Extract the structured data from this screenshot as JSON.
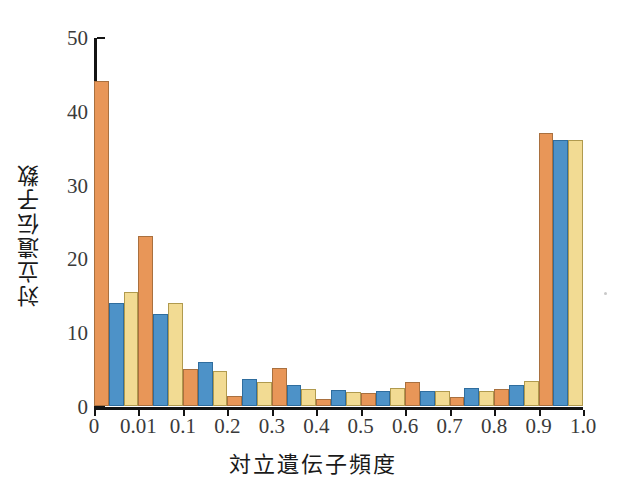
{
  "chart_data": {
    "type": "bar",
    "title": "",
    "subtitle": "",
    "xlabel": "対立遺伝子頻度",
    "ylabel": "対立遺伝子数",
    "categories": [
      "0",
      "0.01",
      "0.1",
      "0.2",
      "0.3",
      "0.4",
      "0.5",
      "0.6",
      "0.7",
      "0.8",
      "0.9"
    ],
    "xtick_labels": [
      "0",
      "0.01",
      "0.1",
      "0.2",
      "0.3",
      "0.4",
      "0.5",
      "0.6",
      "0.7",
      "0.8",
      "0.9",
      "1.0"
    ],
    "ytick_labels": [
      "0",
      "10",
      "20",
      "30",
      "40",
      "50"
    ],
    "ytick_values": [
      0,
      10,
      20,
      30,
      40,
      50
    ],
    "ylim": [
      0,
      50
    ],
    "grid": false,
    "legend": "none",
    "series": [
      {
        "name": "series-1",
        "color": "#E89658",
        "values": [
          44.0,
          23.0,
          5.0,
          1.3,
          5.2,
          1.0,
          1.8,
          3.2,
          1.2,
          2.3,
          37.0
        ]
      },
      {
        "name": "series-2",
        "color": "#4D92C8",
        "values": [
          14.0,
          12.5,
          6.0,
          3.6,
          2.8,
          2.2,
          2.0,
          2.1,
          2.5,
          2.9,
          36.0
        ]
      },
      {
        "name": "series-3",
        "color": "#F2DB93",
        "values": [
          15.5,
          14.0,
          4.8,
          3.2,
          2.3,
          1.9,
          2.4,
          2.0,
          2.0,
          3.4,
          36.0
        ]
      }
    ]
  },
  "axes": {
    "ylabel_text": "対立遺伝子数",
    "xlabel_text": "対立遺伝子頻度"
  },
  "colors": {
    "series1": "#E89658",
    "series2": "#4D92C8",
    "series3": "#F2DB93",
    "axis": "#141414",
    "tick_text": "#3a3a3a",
    "background": "#ffffff"
  }
}
